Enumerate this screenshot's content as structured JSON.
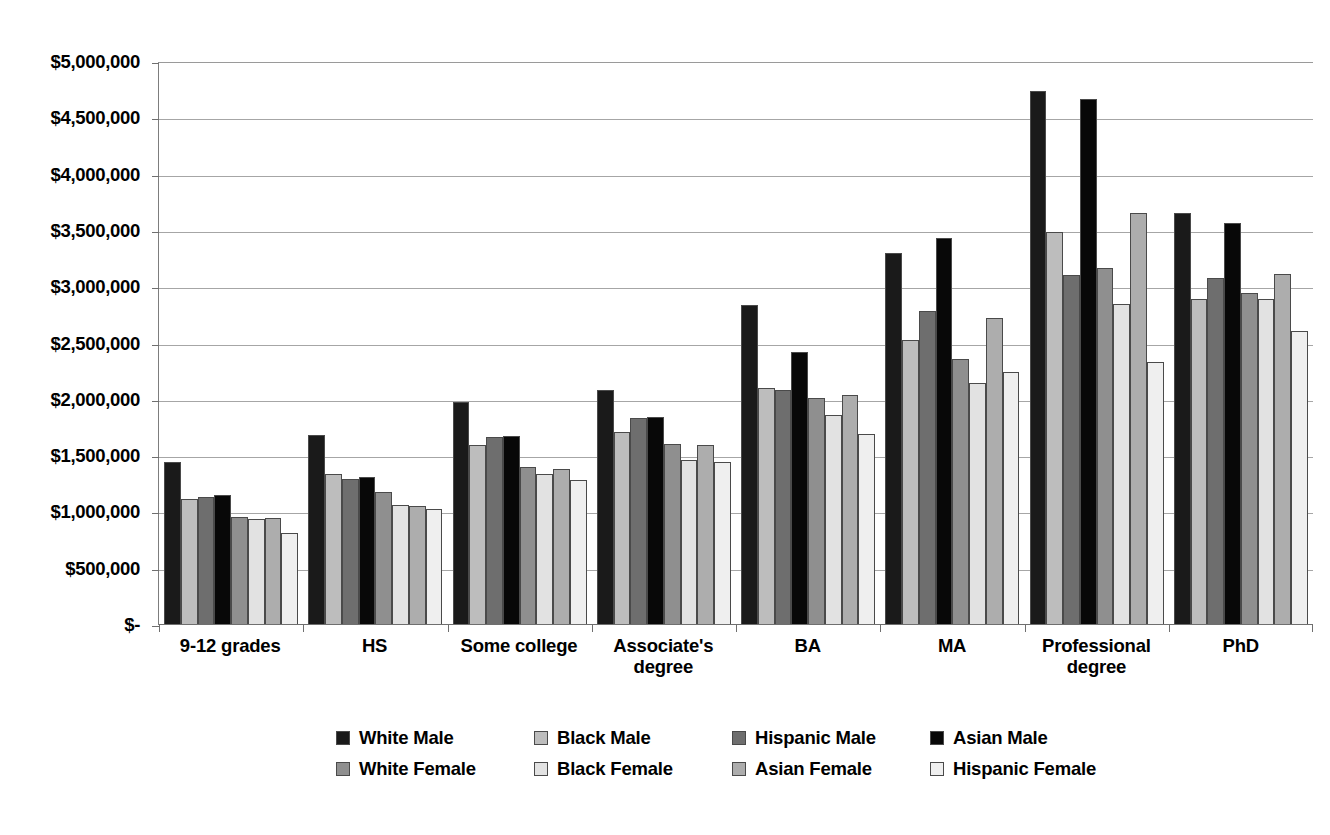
{
  "chart_data": {
    "type": "bar",
    "title": "",
    "subtitle": "",
    "xlabel": "",
    "ylabel": "",
    "ylim": [
      0,
      5000000
    ],
    "ytick_step": 500000,
    "ytick_labels": [
      "$5,000,000",
      "$4,500,000",
      "$4,000,000",
      "$3,500,000",
      "$3,000,000",
      "$2,500,000",
      "$2,000,000",
      "$1,500,000",
      "$1,000,000",
      "$500,000",
      "$-"
    ],
    "ytick_values": [
      5000000,
      4500000,
      4000000,
      3500000,
      3000000,
      2500000,
      2000000,
      1500000,
      1000000,
      500000,
      0
    ],
    "grid": true,
    "legend_position": "bottom",
    "categories": [
      "9-12 grades",
      "HS",
      "Some college",
      "Associate's degree",
      "BA",
      "MA",
      "Professional degree",
      "PhD"
    ],
    "series": [
      {
        "name": "White Male",
        "color": "#1a1a1a",
        "values": [
          1450000,
          1690000,
          1980000,
          2090000,
          2850000,
          3310000,
          4750000,
          3670000
        ]
      },
      {
        "name": "Black Male",
        "color": "#bdbdbd",
        "values": [
          1120000,
          1340000,
          1600000,
          1720000,
          2110000,
          2540000,
          3500000,
          2900000
        ]
      },
      {
        "name": "Hispanic Male",
        "color": "#6e6e6e",
        "values": [
          1140000,
          1300000,
          1670000,
          1840000,
          2090000,
          2790000,
          3110000,
          3090000
        ]
      },
      {
        "name": "Asian Male",
        "color": "#080808",
        "values": [
          1160000,
          1320000,
          1680000,
          1850000,
          2430000,
          3440000,
          4680000,
          3580000
        ]
      },
      {
        "name": "White Female",
        "color": "#8f8f8f",
        "values": [
          960000,
          1180000,
          1410000,
          1610000,
          2020000,
          2370000,
          3180000,
          2950000
        ]
      },
      {
        "name": "Black Female",
        "color": "#e2e2e2",
        "values": [
          940000,
          1070000,
          1340000,
          1470000,
          1870000,
          2150000,
          2860000,
          2900000
        ]
      },
      {
        "name": "Asian Female",
        "color": "#adadad",
        "values": [
          950000,
          1060000,
          1390000,
          1600000,
          2050000,
          2730000,
          3670000,
          3120000
        ]
      },
      {
        "name": "Hispanic Female",
        "color": "#efefef",
        "values": [
          820000,
          1030000,
          1290000,
          1450000,
          1700000,
          2250000,
          2340000,
          2620000
        ]
      }
    ]
  },
  "legend": {
    "items": [
      {
        "label": "White Male"
      },
      {
        "label": "Black Male"
      },
      {
        "label": "Hispanic Male"
      },
      {
        "label": "Asian Male"
      },
      {
        "label": "White Female"
      },
      {
        "label": "Black Female"
      },
      {
        "label": "Asian Female"
      },
      {
        "label": "Hispanic Female"
      }
    ]
  },
  "colors": {
    "gridline": "#a6a6a6",
    "axis": "#6f6f6f",
    "bar_border": "#4a4a4a",
    "background": "#ffffff",
    "text": "#000000"
  }
}
